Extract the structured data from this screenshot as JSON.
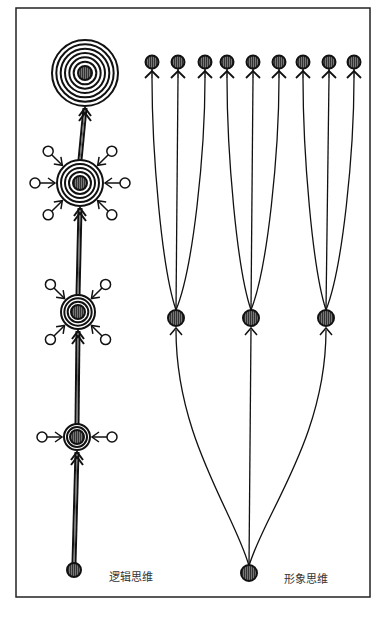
{
  "diagram": {
    "frame": {
      "x": 16,
      "y": 8,
      "width": 354,
      "height": 589
    },
    "labels": {
      "logical_thinking": "逻辑思维",
      "image_thinking": "形象思维"
    },
    "logical_thinking": {
      "base": {
        "x": 74,
        "y": 570
      },
      "stages": [
        {
          "x": 77,
          "y": 437,
          "rings": 2,
          "r": 13,
          "satellites": 2
        },
        {
          "x": 78,
          "y": 312,
          "rings": 3,
          "r": 17,
          "satellites": 4
        },
        {
          "x": 80,
          "y": 183,
          "rings": 4,
          "r": 23,
          "satellites": 6
        },
        {
          "x": 85,
          "y": 73,
          "rings": 6,
          "r": 33,
          "satellites": 0
        }
      ]
    },
    "image_thinking": {
      "base": {
        "x": 249,
        "y": 573
      },
      "middle_nodes": [
        {
          "x": 176,
          "y": 318
        },
        {
          "x": 251,
          "y": 318
        },
        {
          "x": 326,
          "y": 318
        }
      ],
      "top_nodes": [
        {
          "x": 152,
          "y": 62
        },
        {
          "x": 178,
          "y": 62
        },
        {
          "x": 205,
          "y": 62
        },
        {
          "x": 227,
          "y": 62
        },
        {
          "x": 253,
          "y": 62
        },
        {
          "x": 279,
          "y": 62
        },
        {
          "x": 303,
          "y": 62
        },
        {
          "x": 329,
          "y": 62
        },
        {
          "x": 354,
          "y": 62
        }
      ]
    }
  }
}
